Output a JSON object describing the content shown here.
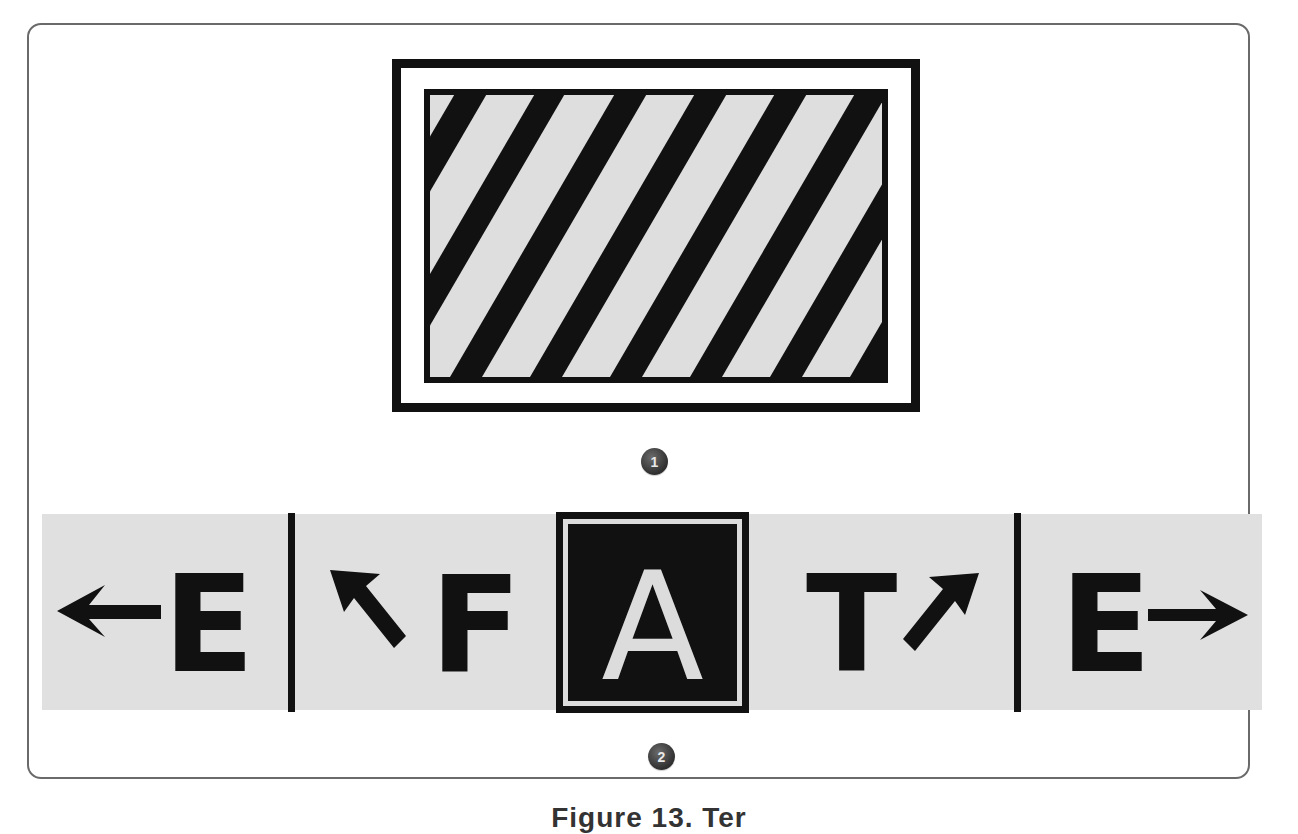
{
  "figure": {
    "panel_1": {
      "marker": "1",
      "description": "Rectangular sign with double black border and diagonal black/grey hatching"
    },
    "panel_2": {
      "marker": "2",
      "segments": [
        {
          "arrow": "arrow-left-icon",
          "letter": "E"
        },
        {
          "arrow": "arrow-up-left-icon",
          "letter": "F"
        },
        {
          "letter": "A",
          "style": "inverted-boxed"
        },
        {
          "letter": "T",
          "arrow": "arrow-up-right-icon"
        },
        {
          "letter": "E",
          "arrow": "arrow-right-icon"
        }
      ]
    },
    "caption": "Figure 13. Ter"
  },
  "colors": {
    "ink": "#111111",
    "sign_background": "#e0e0e0",
    "marker": "#3a3a3a",
    "frame_border": "#6a6a6a"
  }
}
